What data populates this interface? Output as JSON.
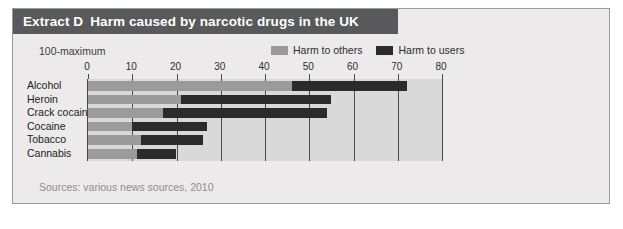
{
  "figure": {
    "extract_tag": "Extract D",
    "title": "Harm caused by narcotic drugs in the UK",
    "sub_caption": "100-maximum",
    "source_note": "Sources: various news sources, 2010"
  },
  "colors": {
    "title_bar_bg": "#58595b",
    "title_text": "#ffffff",
    "panel_bg": "#eceaea",
    "plot_bg": "#d9d9d9",
    "axis": "#4a4a4a",
    "harm_to_others": "#9b9b9b",
    "harm_to_users": "#2b2b2b",
    "source_text": "#8d8d8d"
  },
  "chart_data": {
    "type": "bar",
    "orientation": "horizontal",
    "stacked": true,
    "title": "Harm caused by narcotic drugs in the UK",
    "subtitle": "100-maximum",
    "xlabel": "",
    "ylabel": "",
    "xlim": [
      0,
      80
    ],
    "xticks": [
      0,
      10,
      20,
      30,
      40,
      50,
      60,
      70,
      80
    ],
    "xtick_labels": [
      "0",
      "10",
      "20",
      "30",
      "40",
      "50",
      "60",
      "70",
      "80"
    ],
    "grid": true,
    "legend_position": "top-right",
    "categories": [
      "Alcohol",
      "Heroin",
      "Crack cocaine",
      "Cocaine",
      "Tobacco",
      "Cannabis"
    ],
    "series": [
      {
        "name": "Harm to others",
        "color": "#9b9b9b",
        "values": [
          46,
          21,
          17,
          10,
          12,
          11
        ]
      },
      {
        "name": "Harm to users",
        "color": "#2b2b2b",
        "values": [
          26,
          34,
          37,
          17,
          14,
          9
        ]
      }
    ],
    "totals": [
      72,
      55,
      54,
      27,
      26,
      20
    ]
  }
}
